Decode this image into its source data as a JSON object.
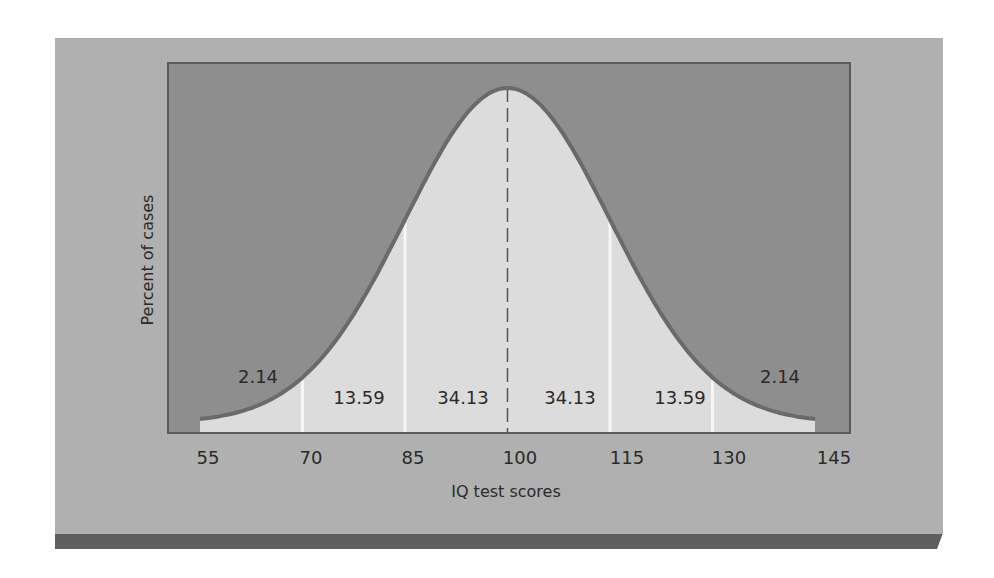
{
  "colors": {
    "page_background": "#ffffff",
    "panel": "#b0b0b0",
    "panel_shadow": "#5e5e5e",
    "plot_background": "#8e8e8e",
    "plot_border": "#5a5a5a",
    "curve_fill": "#dcdcdc",
    "curve_stroke": "#6a6a6a",
    "divider": "#f6f6f6",
    "mean_line": "#555555",
    "text": "#2a2a2a"
  },
  "chart_data": {
    "type": "area",
    "title": "",
    "xlabel": "IQ test scores",
    "ylabel": "Percent of cases",
    "x_ticks": [
      55,
      70,
      85,
      100,
      115,
      130,
      145
    ],
    "x_tick_labels": [
      "55",
      "70",
      "85",
      "100",
      "115",
      "130",
      "145"
    ],
    "xlim": [
      55,
      145
    ],
    "distribution": {
      "kind": "normal",
      "mean": 100,
      "sd": 15
    },
    "dividers": [
      70,
      85,
      115,
      130
    ],
    "mean_line": {
      "x": 100,
      "style": "dashed"
    },
    "regions": [
      {
        "from": 55,
        "to": 70,
        "percent": 2.14,
        "label": "2.14"
      },
      {
        "from": 70,
        "to": 85,
        "percent": 13.59,
        "label": "13.59"
      },
      {
        "from": 85,
        "to": 100,
        "percent": 34.13,
        "label": "34.13"
      },
      {
        "from": 100,
        "to": 115,
        "percent": 34.13,
        "label": "34.13"
      },
      {
        "from": 115,
        "to": 130,
        "percent": 13.59,
        "label": "13.59"
      },
      {
        "from": 130,
        "to": 145,
        "percent": 2.14,
        "label": "2.14"
      }
    ],
    "grid": false,
    "legend": null
  }
}
